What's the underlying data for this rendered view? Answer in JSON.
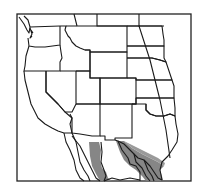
{
  "map": {
    "title": "",
    "region": "Western United States and northern Mexico",
    "frame": {
      "x": 17,
      "y": 14,
      "width": 174,
      "height": 167
    },
    "colors": {
      "background": "#ffffff",
      "border": "#1a1a1a",
      "range_fill": "#808080"
    },
    "legend": [],
    "shaded_regions": [
      {
        "name": "range-west",
        "description": "Gray distribution area in Sonora/Chihuahua"
      },
      {
        "name": "range-east",
        "description": "Gray distribution area from west Texas through Coahuila/Nuevo Leon to Tamaulipas"
      }
    ]
  }
}
